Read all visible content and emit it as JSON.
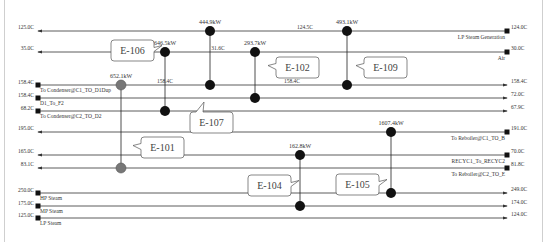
{
  "streams": [
    {
      "id": "s1",
      "y": 31,
      "x1": 38,
      "x2": 507,
      "dir": "left",
      "in_temp": "124.0C",
      "out_temp": "125.0C",
      "name": "LP Steam Generation",
      "mid_temps": [
        {
          "x": 305,
          "text": "124.5C"
        }
      ]
    },
    {
      "id": "s2",
      "y": 52,
      "x1": 38,
      "x2": 507,
      "dir": "left",
      "in_temp": "30.0C",
      "out_temp": "35.0C",
      "name": "Air",
      "mid_temps": [
        {
          "x": 218,
          "text": "31.6C"
        }
      ]
    },
    {
      "id": "s3",
      "y": 85,
      "x1": 38,
      "x2": 507,
      "dir": "right",
      "in_temp": "158.4C",
      "out_temp": "158.4C",
      "name": "To Condenser@C1_TO_D1Dup",
      "mid_temps": [
        {
          "x": 165,
          "text": "158.4C"
        },
        {
          "x": 292,
          "text": "158.4C"
        }
      ]
    },
    {
      "id": "s4",
      "y": 98,
      "x1": 38,
      "x2": 507,
      "dir": "right",
      "in_temp": "158.4C",
      "out_temp": "72.0C",
      "name": "D1_To_F2",
      "mid_temps": []
    },
    {
      "id": "s5",
      "y": 111,
      "x1": 38,
      "x2": 507,
      "dir": "right",
      "in_temp": "68.2C",
      "out_temp": "67.9C",
      "name": "To Condenser@C2_TO_D2",
      "mid_temps": []
    },
    {
      "id": "s6",
      "y": 132,
      "x1": 38,
      "x2": 507,
      "dir": "left",
      "in_temp": "191.0C",
      "out_temp": "195.0C",
      "name": "To Reboiler@C1_TO_B",
      "mid_temps": []
    },
    {
      "id": "s7",
      "y": 155,
      "x1": 38,
      "x2": 507,
      "dir": "left",
      "in_temp": "70.0C",
      "out_temp": "165.0C",
      "name": "RECYC1_To_RECYC2",
      "mid_temps": []
    },
    {
      "id": "s8",
      "y": 168,
      "x1": 38,
      "x2": 507,
      "dir": "left",
      "in_temp": "81.8C",
      "out_temp": "83.1C",
      "name": "To Reboiler@C2_TO_E",
      "mid_temps": []
    },
    {
      "id": "s9",
      "y": 193,
      "x1": 38,
      "x2": 507,
      "dir": "right",
      "in_temp": "250.0C",
      "out_temp": "249.0C",
      "name": "HP Steam",
      "mid_temps": []
    },
    {
      "id": "s10",
      "y": 206,
      "x1": 38,
      "x2": 507,
      "dir": "right",
      "in_temp": "175.0C",
      "out_temp": "174.0C",
      "name": "MP Steam",
      "mid_temps": []
    },
    {
      "id": "s11",
      "y": 218,
      "x1": 38,
      "x2": 507,
      "dir": "right",
      "in_temp": "125.0C",
      "out_temp": "124.0C",
      "name": "LP Steam",
      "mid_temps": []
    }
  ],
  "exchangers": [
    {
      "id": "E-106",
      "x": 165,
      "y1": 52,
      "y2": 111,
      "duty": "646.5kW",
      "color": "#111"
    },
    {
      "id": "E-103",
      "x": 210,
      "y1": 31,
      "y2": 85,
      "duty": "444.9kW",
      "color": "#111"
    },
    {
      "id": "E-102",
      "x": 255,
      "y1": 52,
      "y2": 98,
      "duty": "293.7kW",
      "color": "#111"
    },
    {
      "id": "E-109",
      "x": 347,
      "y1": 31,
      "y2": 85,
      "duty": "493.1kW",
      "color": "#111"
    },
    {
      "id": "E-101",
      "x": 121,
      "y1": 85,
      "y2": 168,
      "duty": "652.1kW",
      "color": "#777"
    },
    {
      "id": "E-104",
      "x": 300,
      "y1": 155,
      "y2": 206,
      "duty": "162.8kW",
      "color": "#111"
    },
    {
      "id": "E-105",
      "x": 391,
      "y1": 132,
      "y2": 193,
      "duty": "1607.4kW",
      "color": "#111"
    }
  ],
  "callouts": [
    {
      "label": "E-106",
      "x": 111,
      "y": 40,
      "w": 43,
      "h": 21,
      "tip": "right"
    },
    {
      "label": "E-102",
      "x": 276,
      "y": 57,
      "w": 43,
      "h": 21,
      "tip": "left"
    },
    {
      "label": "E-109",
      "x": 364,
      "y": 57,
      "w": 43,
      "h": 21,
      "tip": "left"
    },
    {
      "label": "E-107",
      "x": 190,
      "y": 112,
      "w": 43,
      "h": 21,
      "tip": "up"
    },
    {
      "label": "E-101",
      "x": 141,
      "y": 137,
      "w": 43,
      "h": 21,
      "tip": "left"
    },
    {
      "label": "E-104",
      "x": 248,
      "y": 175,
      "w": 43,
      "h": 21,
      "tip": "right"
    },
    {
      "label": "E-105",
      "x": 336,
      "y": 174,
      "w": 43,
      "h": 21,
      "tip": "right"
    }
  ]
}
